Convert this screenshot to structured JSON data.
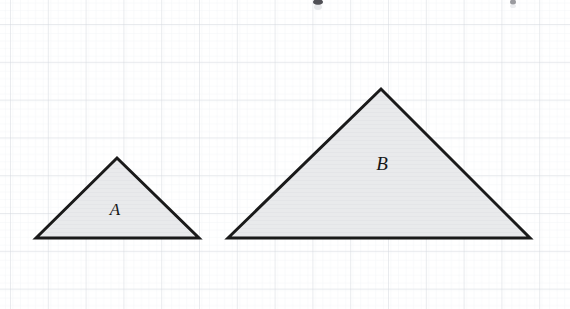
{
  "figure": {
    "background_color": "#ffffff",
    "width": 570,
    "height": 309,
    "grid": {
      "major_color": "#d6d9e0",
      "minor_color": "#eceef2",
      "major_spacing": 37.8,
      "minor_spacing": 7.56,
      "major_origin_x": 10,
      "major_origin_y": 24,
      "visible": true
    },
    "baseline_y": 238,
    "shapes": [
      {
        "id": "triangle-a",
        "label": "A",
        "label_x": 115,
        "label_y": 215,
        "label_size": 17,
        "points": "36,238 117,158 199,238",
        "base_left_x": 36,
        "base_right_x": 199,
        "apex_x": 117,
        "apex_y": 158,
        "base_width": 163,
        "height": 80,
        "fill": "#e9eaec",
        "stroke": "#1a1a1a",
        "stroke_width": 3
      },
      {
        "id": "triangle-b",
        "label": "B",
        "label_x": 382,
        "label_y": 170,
        "label_size": 19,
        "points": "228,238 381,89 530,238",
        "base_left_x": 228,
        "base_right_x": 530,
        "apex_x": 381,
        "apex_y": 89,
        "base_width": 302,
        "height": 149,
        "fill": "#e9eaec",
        "stroke": "#1a1a1a",
        "stroke_width": 3
      }
    ],
    "top_artifact": {
      "visible": true,
      "description": "faint cropped text remnants along the very top edge"
    }
  }
}
